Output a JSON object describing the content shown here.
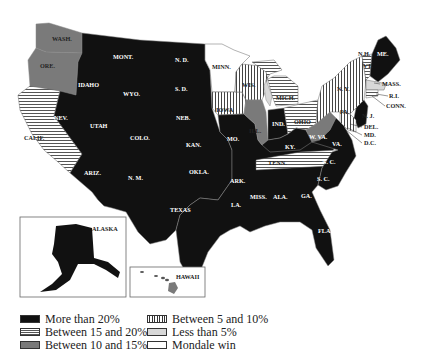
{
  "legend": {
    "items": [
      {
        "key": "more20",
        "label": "More than 20%",
        "pattern": "solid-black",
        "color": "#111111"
      },
      {
        "key": "b15_20",
        "label": "Between 15 and 20%",
        "pattern": "horizontal-stripes",
        "color": "#555555"
      },
      {
        "key": "b10_15",
        "label": "Between 10 and 15%",
        "pattern": "solid-gray",
        "color": "#7a7a7a"
      },
      {
        "key": "b5_10",
        "label": "Between 5 and 10%",
        "pattern": "vertical-stripes",
        "color": "#333333"
      },
      {
        "key": "lt5",
        "label": "Less than 5%",
        "pattern": "solid-light-gray",
        "color": "#d8d8d8"
      },
      {
        "key": "mondale",
        "label": "Mondale win",
        "pattern": "white",
        "color": "#ffffff"
      }
    ]
  },
  "insets": {
    "alaska": "ALASKA",
    "hawaii": "HAWAII"
  },
  "states": {
    "wash": {
      "label": "WASH.",
      "category": "b10_15"
    },
    "ore": {
      "label": "ORE.",
      "category": "b10_15"
    },
    "calif": {
      "label": "CALIF.",
      "category": "b15_20"
    },
    "idaho": {
      "label": "IDAHO",
      "category": "more20"
    },
    "mont": {
      "label": "MONT.",
      "category": "more20"
    },
    "wyo": {
      "label": "WYO.",
      "category": "more20"
    },
    "nev": {
      "label": "NEV.",
      "category": "more20"
    },
    "utah": {
      "label": "UTAH",
      "category": "more20"
    },
    "colo": {
      "label": "COLO.",
      "category": "more20"
    },
    "ariz": {
      "label": "ARIZ.",
      "category": "more20"
    },
    "nm": {
      "label": "N. M.",
      "category": "more20"
    },
    "nd": {
      "label": "N. D.",
      "category": "more20"
    },
    "sd": {
      "label": "S. D.",
      "category": "more20"
    },
    "neb": {
      "label": "NEB.",
      "category": "more20"
    },
    "kan": {
      "label": "KAN.",
      "category": "more20"
    },
    "okla": {
      "label": "OKLA.",
      "category": "more20"
    },
    "texas": {
      "label": "TEXAS",
      "category": "more20"
    },
    "minn": {
      "label": "MINN.",
      "category": "mondale"
    },
    "iowa": {
      "label": "IOWA",
      "category": "b5_10"
    },
    "mo": {
      "label": "MO.",
      "category": "more20"
    },
    "ark": {
      "label": "ARK.",
      "category": "more20"
    },
    "la": {
      "label": "LA.",
      "category": "more20"
    },
    "wis": {
      "label": "WIS.",
      "category": "b5_10"
    },
    "ill": {
      "label": "ILL.",
      "category": "b10_15"
    },
    "mich": {
      "label": "MICH.",
      "category": "b15_20"
    },
    "ind": {
      "label": "IND.",
      "category": "more20"
    },
    "ohio": {
      "label": "OHIO",
      "category": "b15_20"
    },
    "ky": {
      "label": "KY.",
      "category": "more20"
    },
    "tenn": {
      "label": "TENN.",
      "category": "b15_20"
    },
    "miss": {
      "label": "MISS.",
      "category": "more20"
    },
    "ala": {
      "label": "ALA.",
      "category": "more20"
    },
    "ga": {
      "label": "GA.",
      "category": "more20"
    },
    "fla": {
      "label": "FLA.",
      "category": "more20"
    },
    "sc": {
      "label": "S. C.",
      "category": "more20"
    },
    "nc": {
      "label": "N. C.",
      "category": "more20"
    },
    "va": {
      "label": "VA.",
      "category": "more20"
    },
    "wva": {
      "label": "W. VA.",
      "category": "b10_15"
    },
    "pa": {
      "label": "PA.",
      "category": "b5_10"
    },
    "ny": {
      "label": "N. Y.",
      "category": "b5_10"
    },
    "vt": {
      "label": "VT.",
      "category": "b15_20"
    },
    "nh": {
      "label": "N.H.",
      "category": "more20"
    },
    "me": {
      "label": "ME.",
      "category": "more20"
    },
    "mass": {
      "label": "MASS.",
      "category": "lt5"
    },
    "ri": {
      "label": "R.I.",
      "category": "lt5"
    },
    "conn": {
      "label": "CONN.",
      "category": "b15_20"
    },
    "nj": {
      "label": "N. J.",
      "category": "more20"
    },
    "del": {
      "label": "DEL.",
      "category": "b15_20"
    },
    "md": {
      "label": "MD.",
      "category": "b5_10"
    },
    "dc": {
      "label": "D.C.",
      "category": "mondale"
    }
  }
}
